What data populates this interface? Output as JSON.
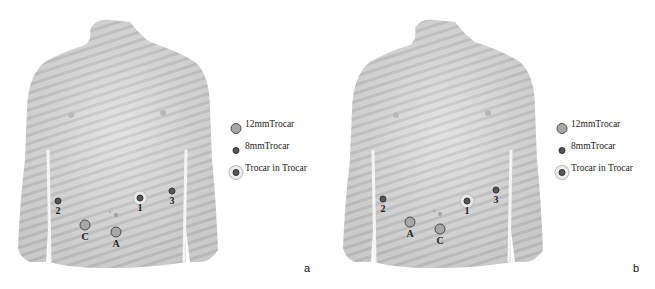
{
  "figure": {
    "panels": [
      {
        "id": "a",
        "label": "a",
        "markers": [
          {
            "type": "8mm",
            "label": "2",
            "x": 58,
            "y": 201
          },
          {
            "type": "trocar-in-trocar",
            "label": "1",
            "x": 140,
            "y": 198
          },
          {
            "type": "8mm",
            "label": "3",
            "x": 172,
            "y": 191
          },
          {
            "type": "12mm",
            "label": "C",
            "x": 85,
            "y": 225
          },
          {
            "type": "12mm",
            "label": "A",
            "x": 116,
            "y": 232
          }
        ]
      },
      {
        "id": "b",
        "label": "b",
        "markers": [
          {
            "type": "8mm",
            "label": "2",
            "x": 56,
            "y": 199
          },
          {
            "type": "trocar-in-trocar",
            "label": "1",
            "x": 140,
            "y": 201
          },
          {
            "type": "8mm",
            "label": "3",
            "x": 169,
            "y": 190
          },
          {
            "type": "12mm",
            "label": "A",
            "x": 83,
            "y": 222
          },
          {
            "type": "12mm",
            "label": "C",
            "x": 113,
            "y": 229
          }
        ]
      }
    ],
    "legend": [
      {
        "type": "12mm",
        "label": "12mmTrocar"
      },
      {
        "type": "8mm",
        "label": "8mmTrocar"
      },
      {
        "type": "trocar-in-trocar",
        "label": "Trocar in Trocar"
      }
    ],
    "colors": {
      "skin": "#d6d6d6",
      "stripe": "#c4c4c4",
      "marker_12mm_fill": "#a8a8a8",
      "marker_8mm_fill": "#555555"
    }
  }
}
